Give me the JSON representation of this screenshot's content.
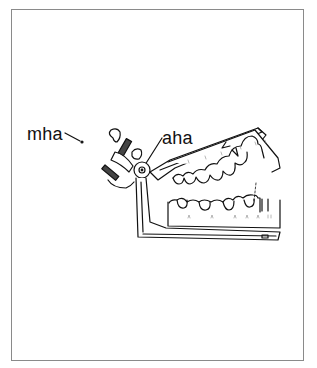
{
  "figure": {
    "labels": [
      {
        "id": "mha",
        "text": "mha"
      },
      {
        "id": "aha",
        "text": "aha"
      }
    ],
    "colors": {
      "background": "#ffffff",
      "frame": "#8a8a8a",
      "ink": "#111111"
    }
  }
}
